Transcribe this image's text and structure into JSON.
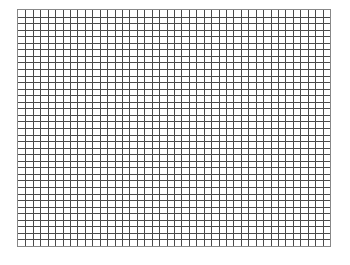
{
  "grid": {
    "columns": 42,
    "rows": 36,
    "line_color": "#4a4a4a",
    "border_color": "#888888",
    "background": "#ffffff"
  }
}
